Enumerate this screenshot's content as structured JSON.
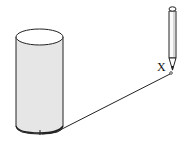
{
  "diagram": {
    "type": "physics-illustration",
    "labels": {
      "point_x": "X"
    },
    "colors": {
      "cylinder_fill": "#e6e6e6",
      "stroke": "#222222",
      "background": "#ffffff"
    },
    "elements": [
      "cylinder",
      "string",
      "pencil",
      "point-x-label"
    ]
  }
}
